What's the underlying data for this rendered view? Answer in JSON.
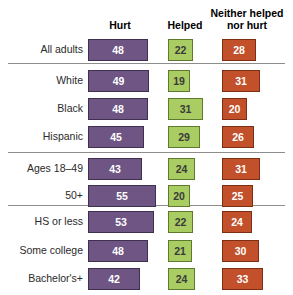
{
  "chart_data": {
    "type": "bar",
    "orientation": "horizontal",
    "title": "",
    "subtitle": "",
    "xlabel": "",
    "ylabel": "",
    "xlim": [
      0,
      60
    ],
    "grid": false,
    "legend_position": "top",
    "categories": [
      "All adults",
      "White",
      "Black",
      "Hispanic",
      "Ages 18–49",
      "50+",
      "HS or less",
      "Some college",
      "Bachelor's+"
    ],
    "series": [
      {
        "name": "Hurt",
        "color": "#6E5583",
        "values": [
          48,
          49,
          48,
          45,
          43,
          55,
          53,
          48,
          42
        ]
      },
      {
        "name": "Helped",
        "color": "#A9CC63",
        "values": [
          22,
          19,
          31,
          29,
          24,
          20,
          22,
          21,
          24
        ]
      },
      {
        "name": "Neither helped\nnor hurt",
        "color": "#C2502A",
        "values": [
          28,
          31,
          20,
          26,
          31,
          25,
          24,
          30,
          33
        ]
      }
    ],
    "group_breaks_after": [
      "All adults",
      "Hispanic",
      "50+"
    ]
  },
  "header": {
    "hurt_label": "Hurt",
    "helped_label": "Helped",
    "neither_label_line1": "Neither helped",
    "neither_label_line2": "nor hurt"
  },
  "rows": [
    {
      "label": "All adults",
      "hurt": "48",
      "helped": "22",
      "neither": "28"
    },
    {
      "label": "White",
      "hurt": "49",
      "helped": "19",
      "neither": "31"
    },
    {
      "label": "Black",
      "hurt": "48",
      "helped": "31",
      "neither": "20"
    },
    {
      "label": "Hispanic",
      "hurt": "45",
      "helped": "29",
      "neither": "26"
    },
    {
      "label": "Ages 18–49",
      "hurt": "43",
      "helped": "24",
      "neither": "31"
    },
    {
      "label": "50+",
      "hurt": "55",
      "helped": "20",
      "neither": "25"
    },
    {
      "label": "HS or less",
      "hurt": "53",
      "helped": "22",
      "neither": "24"
    },
    {
      "label": "Some college",
      "hurt": "48",
      "helped": "21",
      "neither": "30"
    },
    {
      "label": "Bachelor's+",
      "hurt": "42",
      "helped": "24",
      "neither": "33"
    }
  ],
  "colors": {
    "hurt": "#6E5583",
    "helped": "#A9CC63",
    "neither": "#C2502A",
    "separator": "#8D8D8D",
    "background": "#FFFFFF"
  }
}
